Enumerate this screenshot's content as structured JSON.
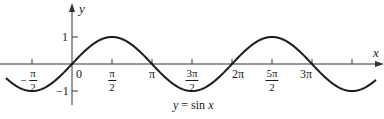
{
  "chart_data": {
    "type": "line",
    "title": "",
    "caption": "y = sin x",
    "xlabel": "x",
    "ylabel": "y",
    "function": "sin(x)",
    "xlim_radians": [
      -2.6,
      11.9
    ],
    "ylim": [
      -1.2,
      1.2
    ],
    "x_ticks": [
      {
        "value": "-π/2",
        "num": "π",
        "den": "2",
        "negative": true
      },
      {
        "value": "0",
        "text": "0"
      },
      {
        "value": "π/2",
        "num": "π",
        "den": "2"
      },
      {
        "value": "π",
        "text": "π"
      },
      {
        "value": "3π/2",
        "num": "3π",
        "den": "2"
      },
      {
        "value": "2π",
        "text": "2π"
      },
      {
        "value": "5π/2",
        "num": "5π",
        "den": "2"
      },
      {
        "value": "3π",
        "text": "3π"
      },
      {
        "value": "7π/2",
        "text": ""
      }
    ],
    "y_ticks": [
      {
        "value": 1,
        "text": "1"
      },
      {
        "value": -1,
        "text": "−1"
      }
    ],
    "key_points": [
      {
        "x": "-π/2",
        "y": -1
      },
      {
        "x": "0",
        "y": 0
      },
      {
        "x": "π/2",
        "y": 1
      },
      {
        "x": "π",
        "y": 0
      },
      {
        "x": "3π/2",
        "y": -1
      },
      {
        "x": "2π",
        "y": 0
      },
      {
        "x": "5π/2",
        "y": 1
      },
      {
        "x": "3π",
        "y": 0
      },
      {
        "x": "7π/2",
        "y": -1
      }
    ],
    "grid": false,
    "legend": null,
    "colors": {
      "line": "#1a1a1a",
      "axes": "#333333"
    }
  },
  "labels": {
    "x_axis": "x",
    "y_axis": "y",
    "y_one": "1",
    "y_neg_one": "−1",
    "origin": "0",
    "pi": "π",
    "two_pi": "2π",
    "three_pi": "3π",
    "pi_num": "π",
    "three_pi_num": "3π",
    "five_pi_num": "5π",
    "den_two": "2",
    "minus": "−",
    "caption_lhs": "y",
    "caption_eq": " = ",
    "caption_fn": "sin ",
    "caption_var": "x"
  }
}
